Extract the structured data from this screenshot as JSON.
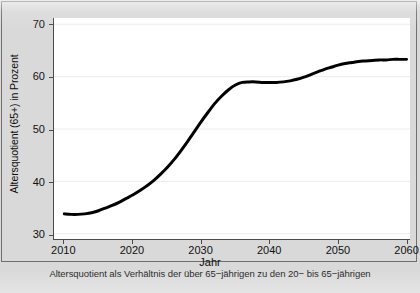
{
  "figure": {
    "background_color": "#d9d9d9",
    "panel_color": "#ffffff",
    "frame_color": "#6f6f6f",
    "line_color": "#000000",
    "grid_color": "#ededed",
    "caption": "Altersquotient als Verhältnis der über 65−jährigen zu den 20− bis 65−jährigen"
  },
  "chart_data": {
    "type": "line",
    "title": "",
    "xlabel": "Jahr",
    "ylabel": "Altersquotient (65+) in Prozent",
    "xlim": [
      2008.5,
      2060.5
    ],
    "ylim": [
      29.0,
      71.2
    ],
    "xticks": [
      2010,
      2020,
      2030,
      2040,
      2050,
      2060
    ],
    "xtick_labels": [
      "2010",
      "2020",
      "2030",
      "2040",
      "2050",
      "2060"
    ],
    "yticks": [
      30,
      40,
      50,
      60,
      70
    ],
    "ytick_labels": [
      "30",
      "40",
      "50",
      "60",
      "70"
    ],
    "grid": "horizontal",
    "legend": "none",
    "series": [
      {
        "name": "Altersquotient (65+)",
        "color": "#000000",
        "line_width": 3,
        "x": [
          2010,
          2011,
          2012,
          2013,
          2014,
          2015,
          2016,
          2017,
          2018,
          2019,
          2020,
          2021,
          2022,
          2023,
          2024,
          2025,
          2026,
          2027,
          2028,
          2029,
          2030,
          2031,
          2032,
          2033,
          2034,
          2035,
          2036,
          2037,
          2038,
          2039,
          2040,
          2041,
          2042,
          2043,
          2044,
          2045,
          2046,
          2047,
          2048,
          2049,
          2050,
          2051,
          2052,
          2053,
          2054,
          2055,
          2056,
          2057,
          2058,
          2059,
          2060
        ],
        "y": [
          33.8,
          33.7,
          33.7,
          33.8,
          34.0,
          34.4,
          34.9,
          35.4,
          36.0,
          36.7,
          37.4,
          38.2,
          39.1,
          40.1,
          41.3,
          42.6,
          44.1,
          45.8,
          47.6,
          49.5,
          51.4,
          53.2,
          54.9,
          56.3,
          57.5,
          58.4,
          58.9,
          59.0,
          59.0,
          58.9,
          58.9,
          58.9,
          59.0,
          59.2,
          59.5,
          59.9,
          60.4,
          60.9,
          61.4,
          61.8,
          62.2,
          62.5,
          62.7,
          62.9,
          63.0,
          63.1,
          63.2,
          63.2,
          63.3,
          63.3,
          63.3
        ]
      }
    ]
  }
}
